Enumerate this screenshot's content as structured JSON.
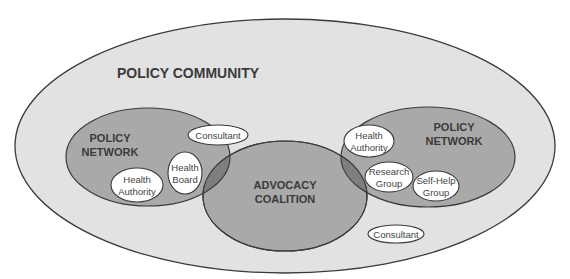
{
  "diagram": {
    "colors": {
      "background": "#ffffff",
      "community_fill": "#e2e2e2",
      "network_fill": "#a9a9a9",
      "coalition_fill": "#a9a9a9",
      "overlap_fill": "#7e7e7e",
      "actor_fill": "#ffffff",
      "stroke": "#3a3a3a",
      "text": "#3a3a3a"
    },
    "policy_community": {
      "label": "POLICY COMMUNITY"
    },
    "left_network": {
      "label_line1": "POLICY",
      "label_line2": "NETWORK",
      "actors": [
        {
          "line1": "Consultant",
          "line2": ""
        },
        {
          "line1": "Health",
          "line2": "Board"
        },
        {
          "line1": "Health",
          "line2": "Authority"
        }
      ]
    },
    "advocacy_coalition": {
      "label_line1": "ADVOCACY",
      "label_line2": "COALITION"
    },
    "right_network": {
      "label_line1": "POLICY",
      "label_line2": "NETWORK",
      "actors": [
        {
          "line1": "Health",
          "line2": "Authority"
        },
        {
          "line1": "Research",
          "line2": "Group"
        },
        {
          "line1": "Self-Help",
          "line2": "Group"
        }
      ]
    },
    "outside_actors": [
      {
        "line1": "Consultant"
      }
    ]
  }
}
